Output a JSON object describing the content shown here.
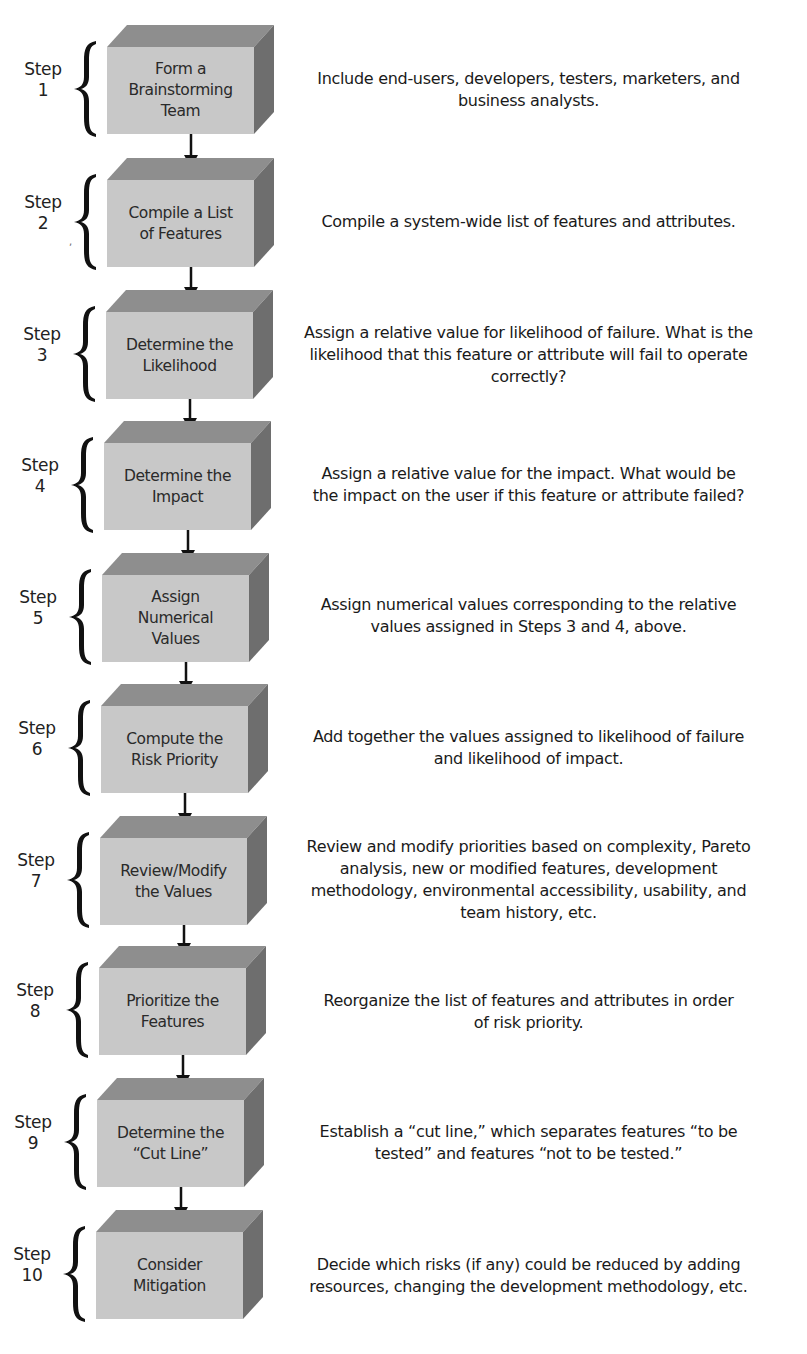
{
  "diagram": {
    "type": "vertical-process-flow",
    "colors": {
      "box_front": "#c8c8c8",
      "box_top": "#8e8e8e",
      "box_side": "#6e6e6e",
      "arrow": "#111111",
      "brace": "#111111",
      "text": "#1a1a1a",
      "background": "#ffffff"
    },
    "steps": [
      {
        "step_label": "Step",
        "step_number": "1",
        "box_lines": [
          "Form a",
          "Brainstorming",
          "Team"
        ],
        "description_lines": [
          "Include end-users, developers, testers, marketers, and",
          "business analysts."
        ]
      },
      {
        "step_label": "Step",
        "step_number": "2",
        "box_lines": [
          "Compile a List",
          "of Features"
        ],
        "description_lines": [
          "Compile a system-wide list of features and attributes."
        ]
      },
      {
        "step_label": "Step",
        "step_number": "3",
        "box_lines": [
          "Determine the",
          "Likelihood"
        ],
        "description_lines": [
          "Assign a relative value for likelihood of failure. What is the",
          "likelihood that this feature or attribute will fail to operate",
          "correctly?"
        ]
      },
      {
        "step_label": "Step",
        "step_number": "4",
        "box_lines": [
          "Determine the",
          "Impact"
        ],
        "description_lines": [
          "Assign a relative value for the impact.  What would be",
          "the impact on the user if this feature or attribute failed?"
        ]
      },
      {
        "step_label": "Step",
        "step_number": "5",
        "box_lines": [
          "Assign",
          "Numerical",
          "Values"
        ],
        "description_lines": [
          "Assign numerical values corresponding to the relative",
          "values assigned in Steps 3 and 4, above."
        ]
      },
      {
        "step_label": "Step",
        "step_number": "6",
        "box_lines": [
          "Compute the",
          "Risk Priority"
        ],
        "description_lines": [
          "Add together the values assigned to likelihood of failure",
          "and likelihood of impact."
        ]
      },
      {
        "step_label": "Step",
        "step_number": "7",
        "box_lines": [
          "Review/Modify",
          "the Values"
        ],
        "description_lines": [
          "Review and modify priorities based on complexity, Pareto",
          "analysis, new or modified features, development",
          "methodology, environmental accessibility, usability, and",
          "team history, etc."
        ]
      },
      {
        "step_label": "Step",
        "step_number": "8",
        "box_lines": [
          "Prioritize the",
          "Features"
        ],
        "description_lines": [
          "Reorganize the list of features and attributes in order",
          "of risk priority."
        ]
      },
      {
        "step_label": "Step",
        "step_number": "9",
        "box_lines": [
          "Determine the",
          "“Cut Line”"
        ],
        "description_lines": [
          "Establish a “cut line,” which separates features “to be",
          "tested” and features “not to be tested.”"
        ]
      },
      {
        "step_label": "Step",
        "step_number": "10",
        "box_lines": [
          "Consider",
          "Mitigation"
        ],
        "description_lines": [
          "Decide which risks (if any) could be reduced by adding",
          "resources, changing the development methodology, etc."
        ]
      }
    ]
  }
}
